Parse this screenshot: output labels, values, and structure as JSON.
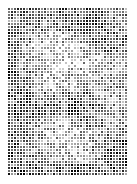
{
  "image": {
    "description": "Halftone dot-pattern picture, grayscale",
    "grid": {
      "cols": 40,
      "rows": 56,
      "pitch_px": 3,
      "dot_px": 2,
      "origin": [
        8,
        8
      ]
    },
    "colors": {
      "background": "#ffffff",
      "ink": "#000000"
    },
    "darkness_map_10x14": [
      [
        5,
        6,
        5,
        5,
        6,
        6,
        6,
        6,
        5,
        4
      ],
      [
        5,
        5,
        5,
        4,
        5,
        6,
        7,
        7,
        6,
        4
      ],
      [
        6,
        5,
        4,
        3,
        3,
        4,
        5,
        6,
        6,
        5
      ],
      [
        6,
        4,
        3,
        2,
        2,
        2,
        3,
        4,
        5,
        5
      ],
      [
        6,
        4,
        3,
        2,
        2,
        2,
        3,
        3,
        4,
        4
      ],
      [
        7,
        5,
        4,
        3,
        2,
        3,
        3,
        4,
        4,
        4
      ],
      [
        6,
        5,
        4,
        3,
        3,
        3,
        4,
        4,
        4,
        4
      ],
      [
        6,
        6,
        5,
        5,
        5,
        6,
        5,
        4,
        4,
        4
      ],
      [
        7,
        6,
        7,
        6,
        5,
        7,
        6,
        5,
        4,
        4
      ],
      [
        6,
        5,
        4,
        4,
        3,
        4,
        5,
        5,
        4,
        4
      ],
      [
        6,
        5,
        4,
        3,
        3,
        3,
        3,
        4,
        5,
        5
      ],
      [
        6,
        5,
        4,
        3,
        3,
        3,
        3,
        4,
        6,
        7
      ],
      [
        7,
        5,
        5,
        4,
        3,
        3,
        3,
        4,
        7,
        7
      ],
      [
        6,
        7,
        6,
        5,
        6,
        7,
        6,
        5,
        6,
        6
      ]
    ]
  }
}
